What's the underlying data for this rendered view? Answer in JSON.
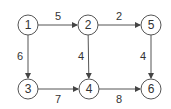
{
  "graph": {
    "nodes": [
      {
        "id": "1",
        "label": "1",
        "x": 28,
        "y": 25
      },
      {
        "id": "2",
        "label": "2",
        "x": 88,
        "y": 25
      },
      {
        "id": "5",
        "label": "5",
        "x": 151,
        "y": 25
      },
      {
        "id": "3",
        "label": "3",
        "x": 28,
        "y": 89
      },
      {
        "id": "4",
        "label": "4",
        "x": 89,
        "y": 89
      },
      {
        "id": "6",
        "label": "6",
        "x": 151,
        "y": 89
      }
    ],
    "edges": [
      {
        "from": "1",
        "to": "2",
        "weight": "5",
        "lx": 58,
        "ly": 16
      },
      {
        "from": "2",
        "to": "5",
        "weight": "2",
        "lx": 119,
        "ly": 16
      },
      {
        "from": "1",
        "to": "3",
        "weight": "6",
        "lx": 20,
        "ly": 56
      },
      {
        "from": "2",
        "to": "4",
        "weight": "4",
        "lx": 81,
        "ly": 56
      },
      {
        "from": "5",
        "to": "6",
        "weight": "4",
        "lx": 143,
        "ly": 56
      },
      {
        "from": "3",
        "to": "4",
        "weight": "7",
        "lx": 58,
        "ly": 99
      },
      {
        "from": "4",
        "to": "6",
        "weight": "8",
        "lx": 119,
        "ly": 99
      }
    ]
  }
}
